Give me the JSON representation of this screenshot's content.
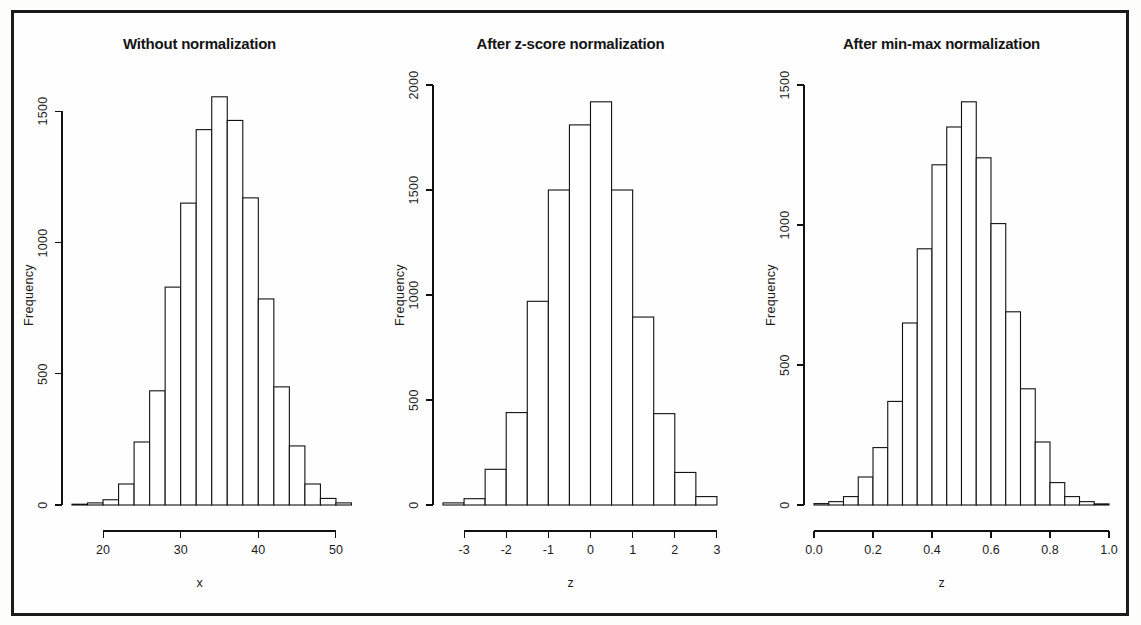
{
  "figure": {
    "background": "#fefefe",
    "frame_color": "#1a1a1a",
    "width": 1141,
    "height": 625
  },
  "panels": [
    {
      "id": "panel-without-normalization",
      "title": "Without normalization",
      "ylabel": "Frequency",
      "xlabel": "x",
      "y_ticks": [
        "0",
        "500",
        "1000",
        "1500"
      ],
      "x_ticks": [
        "20",
        "30",
        "40",
        "50"
      ]
    },
    {
      "id": "panel-z-score",
      "title": "After z-score normalization",
      "ylabel": "Frequency",
      "xlabel": "z",
      "y_ticks": [
        "0",
        "500",
        "1000",
        "1500",
        "2000"
      ],
      "x_ticks": [
        "-3",
        "-2",
        "-1",
        "0",
        "1",
        "2",
        "3"
      ]
    },
    {
      "id": "panel-min-max",
      "title": "After min-max normalization",
      "ylabel": "Frequency",
      "xlabel": "z",
      "y_ticks": [
        "0",
        "500",
        "1000",
        "1500"
      ],
      "x_ticks": [
        "0.0",
        "0.2",
        "0.4",
        "0.6",
        "0.8",
        "1.0"
      ]
    }
  ],
  "chart_data": [
    {
      "type": "bar",
      "title": "Without normalization",
      "xlabel": "x",
      "ylabel": "Frequency",
      "xlim": [
        16,
        54
      ],
      "ylim": [
        0,
        1600
      ],
      "ytick_values": [
        0,
        500,
        1000,
        1500
      ],
      "xtick_values": [
        20,
        30,
        40,
        50
      ],
      "grid": false,
      "legend": "none",
      "bin_width": 2,
      "bin_edges": [
        16,
        18,
        20,
        22,
        24,
        26,
        28,
        30,
        32,
        34,
        36,
        38,
        40,
        42,
        44,
        46,
        48,
        50,
        52
      ],
      "categories": [
        "16-18",
        "18-20",
        "20-22",
        "22-24",
        "24-26",
        "26-28",
        "28-30",
        "30-32",
        "32-34",
        "34-36",
        "36-38",
        "38-40",
        "40-42",
        "42-44",
        "44-46",
        "46-48",
        "48-50",
        "50-52"
      ],
      "values": [
        3,
        8,
        20,
        80,
        240,
        435,
        830,
        1150,
        1430,
        1555,
        1465,
        1170,
        785,
        450,
        225,
        80,
        25,
        8
      ]
    },
    {
      "type": "bar",
      "title": "After z-score normalization",
      "xlabel": "z",
      "ylabel": "Frequency",
      "xlim": [
        -3.5,
        3.5
      ],
      "ylim": [
        0,
        2000
      ],
      "ytick_values": [
        0,
        500,
        1000,
        1500,
        2000
      ],
      "xtick_values": [
        -3,
        -2,
        -1,
        0,
        1,
        2,
        3
      ],
      "grid": false,
      "legend": "none",
      "bin_width": 0.5,
      "bin_edges": [
        -3.5,
        -3.0,
        -2.5,
        -2.0,
        -1.5,
        -1.0,
        -0.5,
        0.0,
        0.5,
        1.0,
        1.5,
        2.0,
        2.5,
        3.0
      ],
      "categories": [
        "-3.5--3.0",
        "-3.0--2.5",
        "-2.5--2.0",
        "-2.0--1.5",
        "-1.5--1.0",
        "-1.0--0.5",
        "-0.5-0.0",
        "0.0-0.5",
        "0.5-1.0",
        "1.0-1.5",
        "1.5-2.0",
        "2.0-2.5",
        "2.5-3.0"
      ],
      "values": [
        10,
        30,
        170,
        440,
        970,
        1500,
        1810,
        1920,
        1500,
        895,
        435,
        155,
        40
      ]
    },
    {
      "type": "bar",
      "title": "After min-max normalization",
      "xlabel": "z",
      "ylabel": "Frequency",
      "xlim": [
        0.0,
        1.0
      ],
      "ylim": [
        0,
        1500
      ],
      "ytick_values": [
        0,
        500,
        1000,
        1500
      ],
      "xtick_values": [
        0.0,
        0.2,
        0.4,
        0.6,
        0.8,
        1.0
      ],
      "grid": false,
      "legend": "none",
      "bin_width": 0.05,
      "bin_edges": [
        0.0,
        0.05,
        0.1,
        0.15,
        0.2,
        0.25,
        0.3,
        0.35,
        0.4,
        0.45,
        0.5,
        0.55,
        0.6,
        0.65,
        0.7,
        0.75,
        0.8,
        0.85,
        0.9,
        0.95,
        1.0
      ],
      "categories": [
        "0.00-0.05",
        "0.05-0.10",
        "0.10-0.15",
        "0.15-0.20",
        "0.20-0.25",
        "0.25-0.30",
        "0.30-0.35",
        "0.35-0.40",
        "0.40-0.45",
        "0.45-0.50",
        "0.50-0.55",
        "0.55-0.60",
        "0.60-0.65",
        "0.65-0.70",
        "0.70-0.75",
        "0.75-0.80",
        "0.80-0.85",
        "0.85-0.90",
        "0.90-0.95",
        "0.95-1.00"
      ],
      "values": [
        5,
        12,
        30,
        100,
        205,
        370,
        650,
        915,
        1215,
        1350,
        1440,
        1240,
        1005,
        690,
        415,
        225,
        80,
        30,
        12,
        4
      ]
    }
  ]
}
